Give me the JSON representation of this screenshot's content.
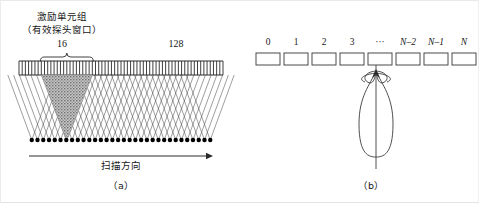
{
  "figure": {
    "panel_a": {
      "group_label_line1": "激励单元组",
      "group_label_line2": "（有效探头窗口）",
      "aperture_count": "16",
      "total_count": "128",
      "scan_direction_label": "扫描方向",
      "caption": "（a）",
      "geometry": {
        "element_count": 64,
        "array_left": 18,
        "array_right": 222,
        "array_top": 60,
        "array_bottom": 74,
        "focus_row_y": 139,
        "aperture_start_index": 7,
        "aperture_span": 16,
        "arrow_y": 155,
        "arrow_x1": 28,
        "arrow_x2": 212,
        "brace_y": 55,
        "brace_left": 32,
        "brace_right": 78
      },
      "colors": {
        "line": "#2b2b2b",
        "beam_line": "#3a3a3a",
        "focus_dot": "#000000",
        "shaded_beam": "#9a9a9a",
        "shaded_beam_fill": "#b5b5b5"
      }
    },
    "panel_b": {
      "elements": [
        {
          "label": "0",
          "italic": false
        },
        {
          "label": "1",
          "italic": false
        },
        {
          "label": "2",
          "italic": false
        },
        {
          "label": "3",
          "italic": false
        },
        {
          "label": "···",
          "italic": false
        },
        {
          "label": "N–2",
          "italic": true
        },
        {
          "label": "N–1",
          "italic": true
        },
        {
          "label": "N",
          "italic": true
        }
      ],
      "caption": "（b）",
      "geometry": {
        "box_width": 24,
        "box_height": 12,
        "box_top": 52,
        "first_box_left": 255,
        "box_pitch": 28,
        "axis_x": 375,
        "axis_top": 64,
        "axis_bottom": 168,
        "lobe_tip_y": 70,
        "lobe_bottom_y": 156,
        "lobe_half_width": 17
      },
      "colors": {
        "box_stroke": "#4a4a4a",
        "lobe_stroke": "#3c3c3c",
        "axis": "#3c3c3c"
      }
    }
  }
}
